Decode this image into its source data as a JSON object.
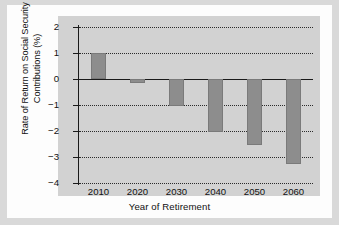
{
  "chart_data": {
    "type": "bar",
    "title": "",
    "xlabel": "Year of Retirement",
    "ylabel": "Rate of Return on Social Security Contributions (%)",
    "ylabel_lines": [
      "Rate of Return on Social Security",
      "Contributions (%)"
    ],
    "categories": [
      "2010",
      "2020",
      "2030",
      "2040",
      "2050",
      "2060"
    ],
    "values": [
      1.0,
      -0.15,
      -1.05,
      -2.05,
      -2.55,
      -3.25
    ],
    "ylim": [
      -4,
      2
    ],
    "yticks": [
      2,
      1,
      0,
      -1,
      -2,
      -3,
      -4
    ],
    "ytick_labels": [
      "2",
      "1",
      "0",
      "−1",
      "−2",
      "−3",
      "−4"
    ],
    "grid": true,
    "grid_style": "dotted",
    "legend": "none",
    "colors": {
      "bar": "#8d8d8d",
      "plot_background": "#d2d2d2",
      "page_background": "#fdfdfd",
      "frame": "#d9d9d9",
      "axis": "#1a1a1a",
      "gridline": "#2b2b2b"
    }
  }
}
